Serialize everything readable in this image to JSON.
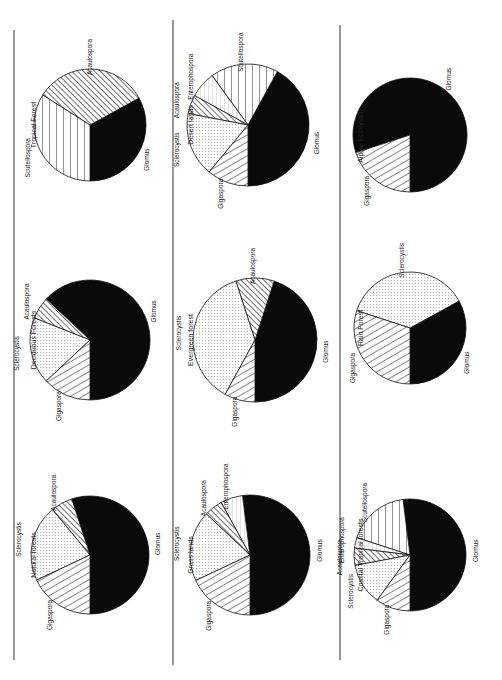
{
  "figure": {
    "orientation": "rotated 90deg counterclockwise",
    "pattern_legend": {
      "Glomus": "solid-black",
      "Gigaspora": "diagonal-hatch-right",
      "Sclerocystis": "dotted",
      "Acaulospora": "diagonal-hatch-dense",
      "Entrophospora": "horizontal-lines-light",
      "Scutellospora": "horizontal-lines"
    }
  },
  "chart_data": [
    {
      "type": "pie",
      "title": "Tropical Forest",
      "categories": [
        "Glomus",
        "Acaulospora",
        "Scutellospora"
      ],
      "values": [
        33,
        33,
        34
      ]
    },
    {
      "type": "pie",
      "title": "Deciduous Forests",
      "categories": [
        "Glomus",
        "Acaulospora",
        "Sclerocystis",
        "Gigaspora"
      ],
      "values": [
        63,
        6,
        18,
        13
      ]
    },
    {
      "type": "pie",
      "title": "Natural forests",
      "categories": [
        "Glomus",
        "Acaulospora",
        "Sclerocystis",
        "Gigaspora"
      ],
      "values": [
        55,
        6,
        21,
        18
      ]
    },
    {
      "type": "pie",
      "title": "Desert lands",
      "categories": [
        "Glomus",
        "Scutellospora",
        "Entrophospora",
        "Acaulospora",
        "Sclerocystis",
        "Gigaspora"
      ],
      "values": [
        42,
        18,
        7,
        5,
        17,
        11
      ]
    },
    {
      "type": "pie",
      "title": "Evergreen forest",
      "categories": [
        "Glomus",
        "Acaulospora",
        "Sclerocystis",
        "Gigaspora"
      ],
      "values": [
        45,
        10,
        37,
        8
      ]
    },
    {
      "type": "pie",
      "title": "Grass lands",
      "categories": [
        "Glomus",
        "Entrophospora",
        "Acaulospora",
        "Sclerocystis",
        "Gigaspora"
      ],
      "values": [
        52,
        6,
        5,
        19,
        18
      ]
    },
    {
      "type": "pie",
      "title": "Alpine Ecosystem",
      "categories": [
        "Glomus",
        "Gigaspora"
      ],
      "values": [
        80,
        20
      ]
    },
    {
      "type": "pie",
      "title": "Rain Forest",
      "categories": [
        "Glomus",
        "Sclerocystis",
        "Gigaspora"
      ],
      "values": [
        33,
        37,
        30
      ]
    },
    {
      "type": "pie",
      "title": "Coastal Tropical forests",
      "categories": [
        "Glomus",
        "Scutellospora",
        "Entrophospora",
        "Acaulospora",
        "Sclerocystis",
        "Gigaspora"
      ],
      "values": [
        52,
        18,
        3,
        5,
        12,
        10
      ]
    }
  ],
  "labels": {
    "tropical": {
      "title": "Tropical Forest",
      "glomus": "Glomus",
      "acaulospora": "Acaulospora",
      "scutellospora": "Scutellospora"
    },
    "deciduous": {
      "title": "Deciduous Forests",
      "glomus": "Glomus",
      "acaulospora": "Acaulospora",
      "sclerocystis": "Sclerocystis",
      "gigaspora": "Gigaspora"
    },
    "natural": {
      "title": "Natural forests",
      "glomus": "Glomus",
      "acaulospora": "Acaulospora",
      "sclerocystis": "Sclerocystis",
      "gigaspora": "Gigaspora"
    },
    "desert": {
      "title": "Desert lands",
      "glomus": "Glomus",
      "scutellospora": "Scutellospora",
      "entrophospora": "Enterophospora",
      "acaulospora": "Acaulospora",
      "sclerocystis": "Sclerocystis",
      "gigaspora": "Gigaspora"
    },
    "evergreen": {
      "title": "Evergreen forest",
      "glomus": "Glomus",
      "acaulospora": "Acaulospora",
      "sclerocystis": "Sclerocystis",
      "gigaspora": "Gigaspora"
    },
    "grass": {
      "title": "Grass lands",
      "glomus": "Glomus",
      "entrophospora": "Enterophospora",
      "acaulospora": "Acaulospora",
      "sclerocystis": "Sclerocystis",
      "gigaspora": "Gigaspora"
    },
    "alpine": {
      "title": "Alpine Ecosystem",
      "glomus": "Glomus",
      "gigaspora": "Gigaspora"
    },
    "rain": {
      "title": "Rain Forest",
      "glomus": "Glomus",
      "sclerocystis": "Sclerocystis",
      "gigaspora": "Gigaspora"
    },
    "coastal": {
      "title": "Coastal Tropical forests",
      "glomus": "Glomus",
      "scutellospora": "Scutellospora",
      "entrophospora": "Enterophospora",
      "acaulospora": "Acaulospora",
      "sclerocystis": "Sclerocystis",
      "gigaspora": "Gigaspora"
    }
  }
}
